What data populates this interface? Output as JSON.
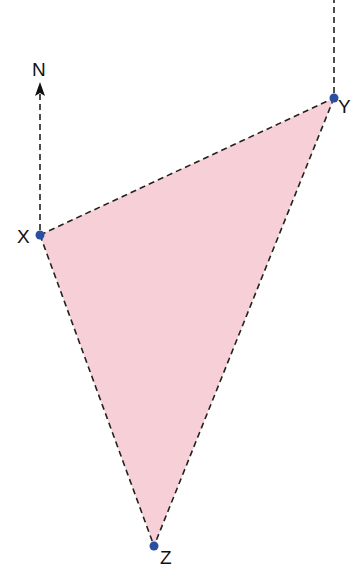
{
  "diagram": {
    "type": "bearing-triangle",
    "north_label": "N",
    "points": {
      "X": {
        "label": "X",
        "x": 40,
        "y": 235
      },
      "Y": {
        "label": "Y",
        "x": 334,
        "y": 98
      },
      "Z": {
        "label": "Z",
        "x": 154,
        "y": 546
      }
    },
    "colors": {
      "fill": "#f6d0d6",
      "point": "#2a4fa0",
      "line": "#222222",
      "text": "#111111"
    }
  }
}
